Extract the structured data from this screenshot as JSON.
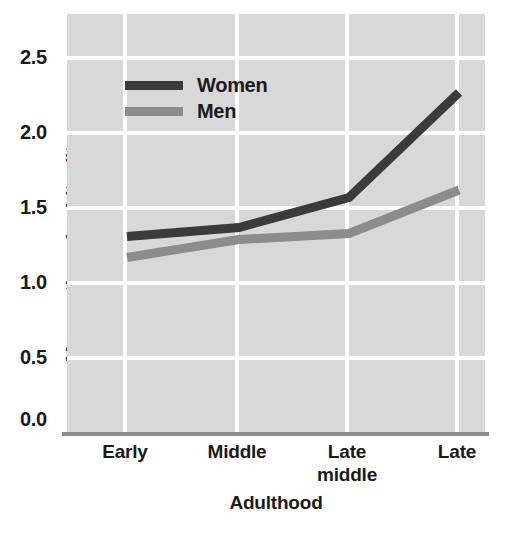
{
  "chart_data": {
    "type": "line",
    "title": "",
    "xlabel": "Adulthood",
    "ylabel": "Mean rating of spirituality",
    "categories": [
      "Early",
      "Middle",
      "Late\nmiddle",
      "Late"
    ],
    "category_labels": [
      {
        "line1": "Early",
        "line2": ""
      },
      {
        "line1": "Middle",
        "line2": ""
      },
      {
        "line1": "Late",
        "line2": "middle"
      },
      {
        "line1": "Late",
        "line2": ""
      }
    ],
    "yticks": [
      "0.0",
      "0.5",
      "1.0",
      "1.5",
      "2.0",
      "2.5"
    ],
    "ylim": [
      0.0,
      2.6
    ],
    "grid": true,
    "legend_position": "upper-left-inside",
    "series": [
      {
        "name": "Women",
        "color": "#3b3b3b",
        "values": [
          1.31,
          1.37,
          1.57,
          2.27
        ]
      },
      {
        "name": "Men",
        "color": "#8c8c8c",
        "values": [
          1.17,
          1.29,
          1.33,
          1.62
        ]
      }
    ],
    "plot_background": "#d8d8d8",
    "gridline_color": "#ffffff",
    "axis_color": "#8d8d8d"
  },
  "axes": {
    "y_label": "Mean rating of spirituality",
    "x_label": "Adulthood",
    "y_tick_0": "0.0",
    "y_tick_1": "0.5",
    "y_tick_2": "1.0",
    "y_tick_3": "1.5",
    "y_tick_4": "2.0",
    "y_tick_5": "2.5"
  },
  "x_ticks": {
    "t0_line1": "Early",
    "t0_line2": "",
    "t1_line1": "Middle",
    "t1_line2": "",
    "t2_line1": "Late",
    "t2_line2": "middle",
    "t3_line1": "Late",
    "t3_line2": ""
  },
  "legend": {
    "women_label": "Women",
    "men_label": "Men"
  }
}
